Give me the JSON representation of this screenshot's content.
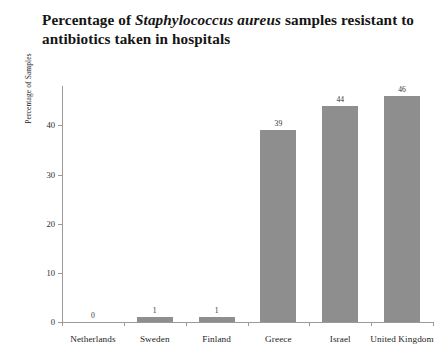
{
  "chart_data": {
    "type": "bar",
    "title": "Percentage of Staphylococcus aureus samples resistant to antibiotics taken in hospitals",
    "title_line1_pre": "Percentage of ",
    "title_line1_italic": "Staphylococcus aureus",
    "title_line1_post": " samples resistant to",
    "title_line2": "antibiotics taken in hospitals",
    "xlabel": "",
    "ylabel": "Percentage of Samples",
    "categories": [
      "Netherlands",
      "Sweden",
      "Finland",
      "Greece",
      "Israel",
      "United Kingdom"
    ],
    "values": [
      0,
      1,
      1,
      39,
      44,
      46
    ],
    "value_labels": [
      "0",
      "1",
      "1",
      "39",
      "44",
      "46"
    ],
    "ylim": [
      0,
      48
    ],
    "yticks": [
      0,
      10,
      20,
      30,
      40
    ],
    "ytick_labels": [
      "0",
      "10",
      "20",
      "30",
      "40"
    ],
    "grid": false,
    "legend": false,
    "bar_color": "#8e8e8e",
    "axis_color": "#9a9a9a",
    "text_color": "#1d1d1d"
  }
}
